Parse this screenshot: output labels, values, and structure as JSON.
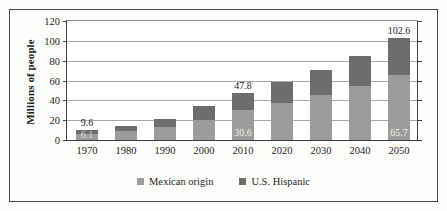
{
  "chart_data": {
    "type": "bar",
    "subtype": "stacked-bar",
    "title": "",
    "xlabel": "",
    "ylabel": "Millions of people",
    "ylim": [
      0,
      120
    ],
    "yticks": [
      0,
      20,
      40,
      60,
      80,
      100,
      120
    ],
    "grid": true,
    "legend_position": "bottom",
    "categories": [
      "1970",
      "1980",
      "1990",
      "2000",
      "2010",
      "2020",
      "2030",
      "2040",
      "2050"
    ],
    "series": [
      {
        "name": "Mexican origin",
        "color": "#9c9c9a",
        "values": [
          6.1,
          8.7,
          13.5,
          20.6,
          30.6,
          37.0,
          45.0,
          54.0,
          65.7
        ]
      },
      {
        "name": "U.S. Hispanic",
        "color": "#6d6d6b",
        "values": [
          3.5,
          5.0,
          8.0,
          13.4,
          17.2,
          22.0,
          26.0,
          31.0,
          36.9
        ]
      }
    ],
    "totals": [
      9.6,
      13.7,
      21.5,
      34.0,
      47.8,
      59.0,
      71.0,
      85.0,
      102.6
    ],
    "annotations": [
      {
        "category": "1970",
        "text": "9.6",
        "position": "above-bar"
      },
      {
        "category": "1970",
        "text": "6.1",
        "position": "inside-bottom-segment"
      },
      {
        "category": "2010",
        "text": "47.8",
        "position": "above-bar"
      },
      {
        "category": "2010",
        "text": "30.6",
        "position": "inside-bottom-segment"
      },
      {
        "category": "2050",
        "text": "102.6",
        "position": "above-bar"
      },
      {
        "category": "2050",
        "text": "65.7",
        "position": "inside-bottom-segment"
      }
    ]
  },
  "legend": {
    "items": [
      {
        "label": "Mexican origin",
        "color": "#9c9c9a"
      },
      {
        "label": "U.S. Hispanic",
        "color": "#6d6d6b"
      }
    ]
  }
}
